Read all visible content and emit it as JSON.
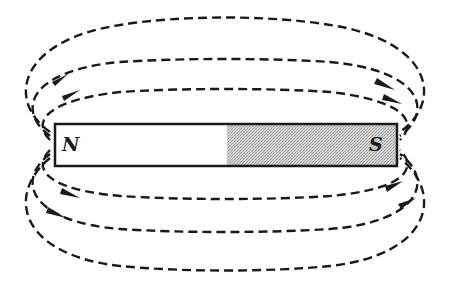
{
  "diagram": {
    "magnet": {
      "north_label": "N",
      "south_label": "S",
      "north_color": "#ffffff",
      "south_color": "#c8c8c8",
      "outline_color": "#1a1a1a"
    },
    "field_lines": {
      "count_above": 3,
      "count_below": 3,
      "style": "dashed",
      "direction": "N to S (arrows point left-to-right, from north pole around to south pole)"
    }
  }
}
